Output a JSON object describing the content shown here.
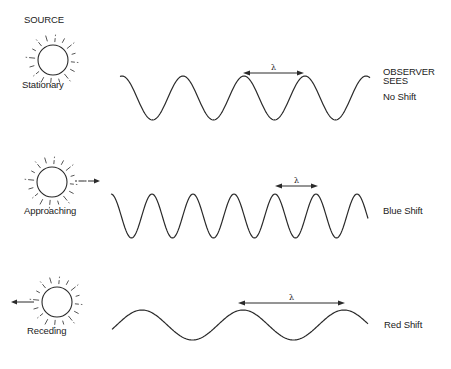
{
  "header": {
    "source_label": "SOURCE",
    "observer_label_line1": "OBSERVER",
    "observer_label_line2": "SEES"
  },
  "colors": {
    "ink": "#2a2a2a",
    "background": "#ffffff"
  },
  "wavelength_symbol": "λ",
  "rows": [
    {
      "source_state": "Stationary",
      "observed": "No Shift",
      "sun": {
        "cx": 53,
        "cy": 60,
        "r": 15,
        "motion_arrow": "none"
      },
      "wave": {
        "x_start": 120,
        "x_end": 370,
        "mid_y": 98,
        "amplitude": 22,
        "period": 61,
        "first_peak_x": 122
      },
      "lambda_arrow": {
        "x1": 243,
        "x2": 304,
        "y": 73
      }
    },
    {
      "source_state": "Approaching",
      "observed": "Blue Shift",
      "sun": {
        "cx": 52,
        "cy": 182,
        "r": 15,
        "motion_arrow": "right"
      },
      "wave": {
        "x_start": 111,
        "x_end": 368,
        "mid_y": 216,
        "amplitude": 22,
        "period": 41,
        "first_peak_x": 152
      },
      "lambda_arrow": {
        "x1": 275,
        "x2": 318,
        "y": 186
      }
    },
    {
      "source_state": "Receding",
      "observed": "Red Shift",
      "sun": {
        "cx": 57,
        "cy": 302,
        "r": 15,
        "motion_arrow": "left"
      },
      "wave": {
        "x_start": 112,
        "x_end": 368,
        "mid_y": 325,
        "amplitude": 15,
        "period": 101,
        "first_peak_x": 142
      },
      "lambda_arrow": {
        "x1": 238,
        "x2": 345,
        "y": 303
      }
    }
  ]
}
